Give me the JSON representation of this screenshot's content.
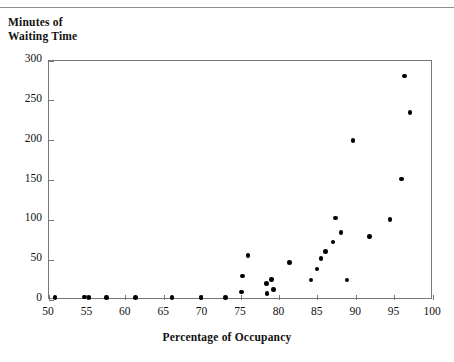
{
  "figure": {
    "top_fragment_text": "· · ·",
    "y_caption_line1": "Minutes of",
    "y_caption_line2": "Waiting Time",
    "x_axis_title": "Percentage of Occupancy",
    "point_color": "#000000",
    "frame_color": "#777777",
    "rule_color": "#8d8d8d",
    "background_color": "#ffffff"
  },
  "chart_data": {
    "type": "scatter",
    "title": "",
    "xlabel": "Percentage of Occupancy",
    "ylabel": "Minutes of Waiting Time",
    "xlim": [
      50,
      100
    ],
    "ylim": [
      0,
      300
    ],
    "xticks": [
      50,
      55,
      60,
      65,
      70,
      75,
      80,
      85,
      90,
      95,
      100
    ],
    "yticks": [
      0,
      50,
      100,
      150,
      200,
      250,
      300
    ],
    "xtick_labels": [
      "50",
      "55",
      "60",
      "65",
      "70",
      "75",
      "80",
      "85",
      "90",
      "95",
      "100"
    ],
    "ytick_labels": [
      "0",
      "50",
      "100",
      "150",
      "200",
      "250",
      "300"
    ],
    "grid": false,
    "legend": false,
    "marker": "filled-circle",
    "series": [
      {
        "name": "Waiting time vs occupancy",
        "points": [
          [
            50.8,
            3
          ],
          [
            54.6,
            4
          ],
          [
            55.2,
            3
          ],
          [
            57.5,
            3
          ],
          [
            61.3,
            3
          ],
          [
            66.0,
            3
          ],
          [
            69.8,
            3
          ],
          [
            73.0,
            3
          ],
          [
            75.1,
            10
          ],
          [
            75.2,
            30
          ],
          [
            75.9,
            56
          ],
          [
            78.3,
            21
          ],
          [
            78.4,
            8
          ],
          [
            79.0,
            26
          ],
          [
            79.2,
            13
          ],
          [
            81.3,
            47
          ],
          [
            84.1,
            25
          ],
          [
            84.9,
            39
          ],
          [
            85.4,
            52
          ],
          [
            86.0,
            61
          ],
          [
            87.0,
            73
          ],
          [
            87.3,
            103
          ],
          [
            88.0,
            85
          ],
          [
            88.8,
            25
          ],
          [
            89.6,
            200
          ],
          [
            91.7,
            80
          ],
          [
            94.4,
            101
          ],
          [
            95.9,
            152
          ],
          [
            96.3,
            281
          ],
          [
            97.0,
            235
          ]
        ]
      }
    ]
  }
}
